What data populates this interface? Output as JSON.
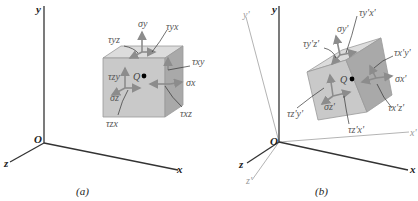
{
  "panels": [
    {
      "caption": "(a)",
      "axes": {
        "y": "y",
        "x": "x",
        "z": "z",
        "origin": "O"
      },
      "point": "Q",
      "labels": {
        "sigma_y": "σy",
        "tau_yz": "τyz",
        "tau_yx": "τyx",
        "tau_xy": "τxy",
        "sigma_x": "σx",
        "tau_xz": "τxz",
        "tau_zy": "τzy",
        "sigma_z": "σz",
        "tau_zx": "τzx"
      }
    },
    {
      "caption": "(b)",
      "axes": {
        "y": "y",
        "x": "x",
        "z": "z",
        "yp": "y'",
        "xp": "x'",
        "zp": "z'",
        "origin": "O"
      },
      "point": "Q",
      "labels": {
        "sigma_y": "σy'",
        "tau_yz": "τy'z'",
        "tau_yx": "τy'x'",
        "tau_xy": "τx'y'",
        "sigma_x": "σx'",
        "tau_xz": "τx'z'",
        "tau_zy": "τz'y'",
        "sigma_z": "σz'",
        "tau_zx": "τz'x'"
      }
    }
  ],
  "colors": {
    "cube_front": "#c9c9c9",
    "cube_top": "#dcdcdc",
    "cube_side": "#a9a9a9",
    "arrow": "#8c8c8c",
    "axis": "#333333",
    "label": "#555555"
  }
}
